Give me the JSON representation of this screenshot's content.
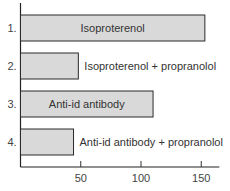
{
  "chart_data": {
    "type": "bar",
    "orientation": "horizontal",
    "title": "",
    "xlabel": "",
    "ylabel": "",
    "categories": [
      "1.",
      "2.",
      "3.",
      "4."
    ],
    "bar_labels": [
      "Isoproterenol",
      "Isoproterenol + propranolol",
      "Anti-id antibody",
      "Anti-id antibody + propranolol"
    ],
    "label_inside": [
      true,
      false,
      true,
      false
    ],
    "values": [
      153,
      48,
      110,
      44
    ],
    "xlim": [
      0,
      165
    ],
    "xticks": [
      50,
      100,
      150
    ],
    "xtick_labels": [
      "50",
      "100",
      "150"
    ],
    "grid": false,
    "bar_color": "#d9d9d9"
  }
}
